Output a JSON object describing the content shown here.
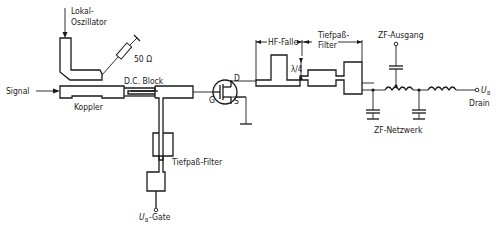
{
  "diagram": {
    "labels": {
      "local_osc_line1": "Lokal-",
      "local_osc_line2": "Oszillator",
      "resistor": "50 Ω",
      "dc_block": "D.C. Block",
      "signal": "Signal",
      "coupler": "Koppler",
      "gate": "G",
      "drain": "D",
      "source": "S",
      "lowpass_gate": "Tiefpaß-Filter",
      "ub_gate_symbol": "U",
      "ub_gate_sub": "B",
      "ub_gate_suffix": "-Gate",
      "hf_trap": "HF-Falle",
      "lowpass_drain_line1": "Tiefpaß-",
      "lowpass_drain_line2": "Filter",
      "lambda_quarter": "λ/4",
      "if_output": "ZF-Ausgang",
      "if_network": "ZF-Netzwerk",
      "ub_drain_symbol": "U",
      "ub_drain_sub": "B",
      "drain_label": "Drain"
    }
  }
}
